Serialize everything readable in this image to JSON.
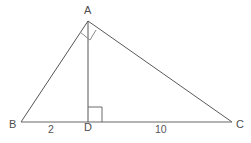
{
  "figure": {
    "type": "geometry-diagram",
    "shape": "right-triangle-with-altitude",
    "background_color": "#ffffff",
    "stroke_color": "#555555",
    "label_color": "#4d4d4d",
    "stroke_width": 1,
    "vertices": [
      {
        "id": "A",
        "label": "A",
        "x": 88,
        "y": 21
      },
      {
        "id": "B",
        "label": "B",
        "x": 21,
        "y": 122
      },
      {
        "id": "C",
        "label": "C",
        "x": 232,
        "y": 122
      },
      {
        "id": "D",
        "label": "D",
        "x": 88,
        "y": 122
      }
    ],
    "edges": [
      {
        "id": "AB",
        "from": "A",
        "to": "B"
      },
      {
        "id": "AC",
        "from": "A",
        "to": "C"
      },
      {
        "id": "BC",
        "from": "B",
        "to": "C"
      },
      {
        "id": "AD",
        "from": "A",
        "to": "D"
      }
    ],
    "segment_labels": [
      {
        "id": "BD",
        "text": "2",
        "between": "B-D"
      },
      {
        "id": "DC",
        "text": "10",
        "between": "D-C"
      }
    ],
    "right_angle_marks": [
      {
        "id": "angle-D",
        "at": "D",
        "description": "square marker between DA and DC"
      },
      {
        "id": "angle-A",
        "at": "A",
        "description": "square marker between AB and AD"
      }
    ]
  }
}
